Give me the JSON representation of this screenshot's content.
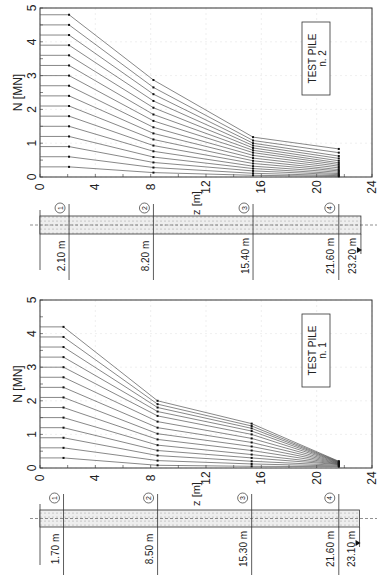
{
  "figure": {
    "orientation": "rotated 90 degrees counter-clockwise",
    "axis_x_label": "z [m]",
    "axis_y_label": "N [MN]"
  },
  "chart_data": [
    {
      "type": "line",
      "title": "TEST PILE n. 2",
      "legend": [
        "TEST PILE",
        "n. 2"
      ],
      "xlabel": "z [m]",
      "ylabel": "N [MN]",
      "xlim": [
        0,
        24
      ],
      "ylim": [
        0,
        5
      ],
      "xticks": [
        0,
        4,
        8,
        12,
        16,
        20,
        24
      ],
      "yticks": [
        0,
        1,
        2,
        3,
        4,
        5
      ],
      "grid": true,
      "x": [
        0,
        2.1,
        8.2,
        15.4,
        21.6
      ],
      "series": [
        {
          "name": "load step 16",
          "values": [
            4.8,
            4.8,
            2.87,
            1.18,
            0.83
          ]
        },
        {
          "name": "load step 15",
          "values": [
            4.5,
            4.5,
            2.65,
            1.08,
            0.72
          ]
        },
        {
          "name": "load step 14",
          "values": [
            4.2,
            4.2,
            2.45,
            1.0,
            0.62
          ]
        },
        {
          "name": "load step 13",
          "values": [
            3.9,
            3.9,
            2.25,
            0.93,
            0.55
          ]
        },
        {
          "name": "load step 12",
          "values": [
            3.6,
            3.6,
            2.05,
            0.86,
            0.48
          ]
        },
        {
          "name": "load step 11",
          "values": [
            3.3,
            3.3,
            1.85,
            0.79,
            0.42
          ]
        },
        {
          "name": "load step 10",
          "values": [
            3.0,
            3.0,
            1.66,
            0.72,
            0.37
          ]
        },
        {
          "name": "load step 9",
          "values": [
            2.7,
            2.7,
            1.47,
            0.64,
            0.32
          ]
        },
        {
          "name": "load step 8",
          "values": [
            2.4,
            2.4,
            1.29,
            0.56,
            0.27
          ]
        },
        {
          "name": "load step 7",
          "values": [
            2.1,
            2.1,
            1.11,
            0.48,
            0.22
          ]
        },
        {
          "name": "load step 6",
          "values": [
            1.8,
            1.8,
            0.93,
            0.4,
            0.18
          ]
        },
        {
          "name": "load step 5",
          "values": [
            1.5,
            1.5,
            0.76,
            0.32,
            0.14
          ]
        },
        {
          "name": "load step 4",
          "values": [
            1.2,
            1.2,
            0.59,
            0.25,
            0.1
          ]
        },
        {
          "name": "load step 3",
          "values": [
            0.9,
            0.9,
            0.43,
            0.18,
            0.07
          ]
        },
        {
          "name": "load step 2",
          "values": [
            0.6,
            0.6,
            0.28,
            0.11,
            0.04
          ]
        },
        {
          "name": "load step 1",
          "values": [
            0.3,
            0.3,
            0.13,
            0.05,
            0.02
          ]
        }
      ],
      "pile_profile": {
        "gauges": [
          {
            "id": "1",
            "depth_label": "2.10 m",
            "z": 2.1
          },
          {
            "id": "2",
            "depth_label": "8.20 m",
            "z": 8.2
          },
          {
            "id": "3",
            "depth_label": "15.40 m",
            "z": 15.4
          },
          {
            "id": "4",
            "depth_label": "21.60 m",
            "z": 21.6
          }
        ],
        "toe_label": "23.20 m",
        "toe_z": 23.2
      }
    },
    {
      "type": "line",
      "title": "TEST PILE n. 1",
      "legend": [
        "TEST PILE",
        "n. 1"
      ],
      "xlabel": "z [m]",
      "ylabel": "N [MN]",
      "xlim": [
        0,
        24
      ],
      "ylim": [
        0,
        5
      ],
      "xticks": [
        0,
        4,
        8,
        12,
        16,
        20,
        24
      ],
      "yticks": [
        0,
        1,
        2,
        3,
        4,
        5
      ],
      "grid": true,
      "x": [
        0,
        1.7,
        8.5,
        15.3,
        21.6
      ],
      "series": [
        {
          "name": "load step 14",
          "values": [
            4.2,
            4.2,
            2.0,
            1.32,
            0.2
          ]
        },
        {
          "name": "load step 13",
          "values": [
            3.9,
            3.9,
            1.9,
            1.25,
            0.19
          ]
        },
        {
          "name": "load step 12",
          "values": [
            3.6,
            3.6,
            1.8,
            1.18,
            0.18
          ]
        },
        {
          "name": "load step 11",
          "values": [
            3.3,
            3.3,
            1.68,
            1.1,
            0.17
          ]
        },
        {
          "name": "load step 10",
          "values": [
            3.0,
            3.0,
            1.55,
            1.0,
            0.16
          ]
        },
        {
          "name": "load step 9",
          "values": [
            2.7,
            2.7,
            1.38,
            0.88,
            0.15
          ]
        },
        {
          "name": "load step 8",
          "values": [
            2.4,
            2.4,
            1.2,
            0.76,
            0.14
          ]
        },
        {
          "name": "load step 7",
          "values": [
            2.1,
            2.1,
            1.02,
            0.64,
            0.13
          ]
        },
        {
          "name": "load step 6",
          "values": [
            1.8,
            1.8,
            0.85,
            0.52,
            0.12
          ]
        },
        {
          "name": "load step 5",
          "values": [
            1.5,
            1.5,
            0.68,
            0.4,
            0.11
          ]
        },
        {
          "name": "load step 4",
          "values": [
            1.2,
            1.2,
            0.52,
            0.3,
            0.1
          ]
        },
        {
          "name": "load step 3",
          "values": [
            0.9,
            0.9,
            0.37,
            0.2,
            0.08
          ]
        },
        {
          "name": "load step 2",
          "values": [
            0.6,
            0.6,
            0.22,
            0.12,
            0.06
          ]
        },
        {
          "name": "load step 1",
          "values": [
            0.3,
            0.3,
            0.08,
            0.05,
            0.04
          ]
        }
      ],
      "pile_profile": {
        "gauges": [
          {
            "id": "1",
            "depth_label": "1.70 m",
            "z": 1.7
          },
          {
            "id": "2",
            "depth_label": "8.50 m",
            "z": 8.5
          },
          {
            "id": "3",
            "depth_label": "15.30 m",
            "z": 15.3
          },
          {
            "id": "4",
            "depth_label": "21.60 m",
            "z": 21.6
          }
        ],
        "toe_label": "23.10 m",
        "toe_z": 23.1
      }
    }
  ],
  "colors": {
    "line": "#555555",
    "marker": "#111111",
    "axis": "#333333",
    "grid": "#e4e4e4",
    "pile_fill": "#eeeeee"
  }
}
